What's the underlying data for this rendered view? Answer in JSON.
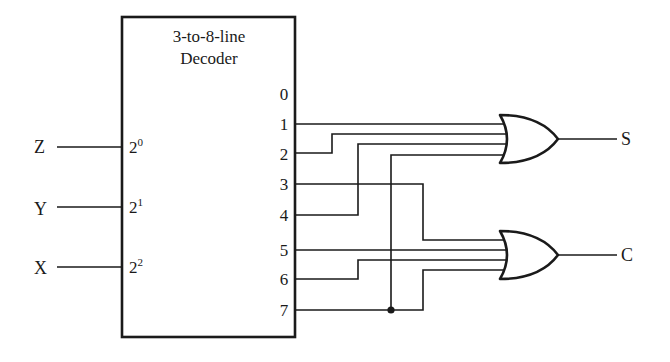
{
  "decoder": {
    "title_line1": "3-to-8-line",
    "title_line2": "Decoder",
    "inputs": [
      {
        "signal": "Z",
        "pin_base": "2",
        "pin_exp": "0"
      },
      {
        "signal": "Y",
        "pin_base": "2",
        "pin_exp": "1"
      },
      {
        "signal": "X",
        "pin_base": "2",
        "pin_exp": "2"
      }
    ],
    "outputs": [
      "0",
      "1",
      "2",
      "3",
      "4",
      "5",
      "6",
      "7"
    ]
  },
  "gates": [
    {
      "type": "OR",
      "output_label": "S",
      "inputs_from": [
        "1",
        "2",
        "4",
        "7"
      ]
    },
    {
      "type": "OR",
      "output_label": "C",
      "inputs_from": [
        "3",
        "5",
        "6",
        "7"
      ]
    }
  ],
  "colors": {
    "stroke": "#1a1a1a",
    "background": "#ffffff"
  }
}
